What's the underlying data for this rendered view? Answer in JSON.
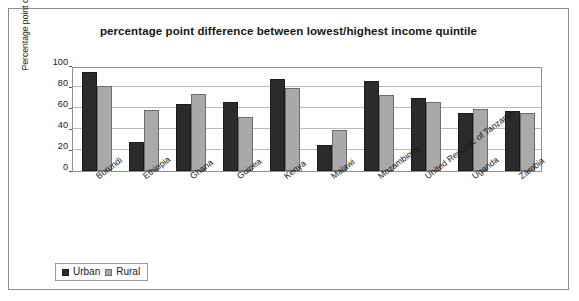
{
  "chart_data": {
    "type": "bar",
    "title": "percentage point difference between lowest/highest income quintile",
    "xlabel": "",
    "ylabel": "Percentage point difference",
    "ylim": [
      0,
      100
    ],
    "yticks": [
      0,
      20,
      40,
      60,
      80,
      100
    ],
    "grid": true,
    "legend_position": "bottom-left",
    "categories": [
      "Burundi",
      "Ethiopia",
      "Ghana",
      "Guinea",
      "Kenya",
      "Malawi",
      "Mozambique",
      "United Republic of Tanzania",
      "Uganda",
      "Zambia"
    ],
    "series": [
      {
        "name": "Urban",
        "color": "#2b2b2b",
        "values": [
          94,
          28,
          64,
          66,
          88,
          25,
          86,
          70,
          55,
          57
        ]
      },
      {
        "name": "Rural",
        "color": "#a9a9a9",
        "values": [
          81,
          58,
          73,
          51,
          79,
          39,
          72,
          66,
          59,
          55
        ]
      }
    ]
  }
}
